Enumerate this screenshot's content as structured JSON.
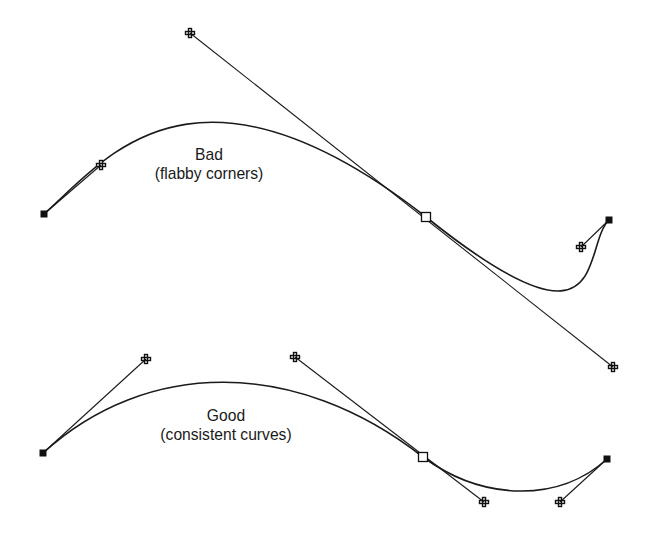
{
  "figure": {
    "bad_example": {
      "title": "Bad",
      "subtitle": "(flabby corners)",
      "label_center": [
        209,
        146
      ],
      "start_anchor": [
        44,
        214
      ],
      "start_handle": [
        101,
        165
      ],
      "middle_anchor": [
        426,
        217
      ],
      "middle_handle_in": [
        190,
        33
      ],
      "middle_handle_out": [
        613,
        367
      ],
      "end_handle": [
        581,
        247
      ],
      "end_anchor": [
        609,
        220
      ]
    },
    "good_example": {
      "title": "Good",
      "subtitle": "(consistent curves)",
      "label_center": [
        226,
        407
      ],
      "start_anchor": [
        43,
        453
      ],
      "start_handle": [
        146,
        359
      ],
      "middle_anchor": [
        423,
        457
      ],
      "middle_handle_in": [
        295,
        357
      ],
      "middle_handle_out": [
        484,
        502
      ],
      "end_handle": [
        560,
        502
      ],
      "end_anchor": [
        607,
        459
      ]
    },
    "legend": {
      "end_anchor_icon": "filled-square-anchor-icon",
      "smooth_anchor_icon": "hollow-square-anchor-icon",
      "handle_icon": "direction-handle-icon"
    },
    "colors": {
      "stroke": "#1a1a1a",
      "background": "#ffffff"
    }
  }
}
